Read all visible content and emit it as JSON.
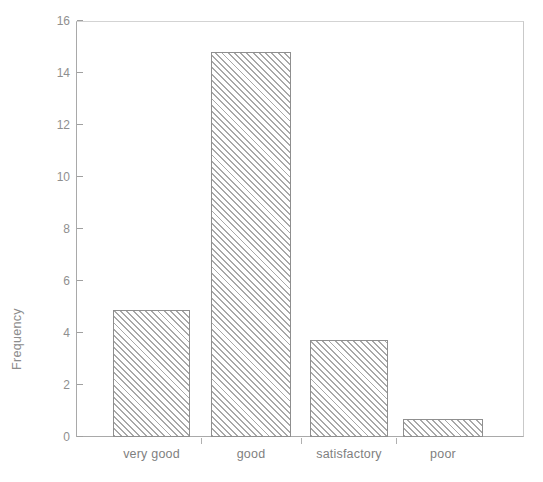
{
  "chart_data": {
    "type": "bar",
    "title": "",
    "xlabel": "",
    "ylabel": "Frequency",
    "categories": [
      "very good",
      "good",
      "satisfactory",
      "poor"
    ],
    "values": [
      4.9,
      14.8,
      3.75,
      0.7
    ],
    "ylim": [
      0,
      16
    ],
    "yticks": [
      0,
      2,
      4,
      6,
      8,
      10,
      12,
      14,
      16
    ],
    "ytick_labels": [
      "0",
      "2",
      "4",
      "6",
      "8",
      "10",
      "12",
      "14",
      "16"
    ],
    "grid": false,
    "legend": "none",
    "bar_fill": "#ffffff",
    "bar_hatch": "diagonal-forward-slash",
    "bar_hatch_color": "#a8a8a8",
    "bar_edge_color": "#8f8f8f",
    "axis_color": "#a9a9a9",
    "text_color": "#8a8a8a",
    "background": "#ffffff"
  }
}
